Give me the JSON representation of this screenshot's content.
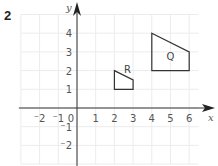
{
  "question_number": "2",
  "chart_data": {
    "type": "coordinate-grid",
    "xlabel": "x",
    "ylabel": "y",
    "xlim": [
      -3,
      6.5
    ],
    "ylim": [
      -3,
      5
    ],
    "x_ticks": [
      {
        "value": -2,
        "label": "⁻2"
      },
      {
        "value": -1,
        "label": "⁻1"
      },
      {
        "value": 1,
        "label": "1"
      },
      {
        "value": 2,
        "label": "2"
      },
      {
        "value": 3,
        "label": "3"
      },
      {
        "value": 4,
        "label": "4"
      },
      {
        "value": 5,
        "label": "5"
      },
      {
        "value": 6,
        "label": "6"
      }
    ],
    "y_ticks": [
      {
        "value": 4,
        "label": "4"
      },
      {
        "value": 3,
        "label": "3"
      },
      {
        "value": 2,
        "label": "2"
      },
      {
        "value": 1,
        "label": "1"
      },
      {
        "value": -1,
        "label": "⁻1"
      },
      {
        "value": -2,
        "label": "⁻2"
      }
    ],
    "origin_label": "0",
    "shapes": [
      {
        "name": "Q",
        "points": [
          [
            4,
            4
          ],
          [
            6,
            3
          ],
          [
            6,
            2
          ],
          [
            4,
            2
          ]
        ],
        "label_at": [
          5,
          2.8
        ]
      },
      {
        "name": "R",
        "points": [
          [
            2,
            2
          ],
          [
            3,
            1.5
          ],
          [
            3,
            1
          ],
          [
            2,
            1
          ]
        ],
        "label_at": [
          2.7,
          2.1
        ]
      }
    ],
    "grid": true
  }
}
